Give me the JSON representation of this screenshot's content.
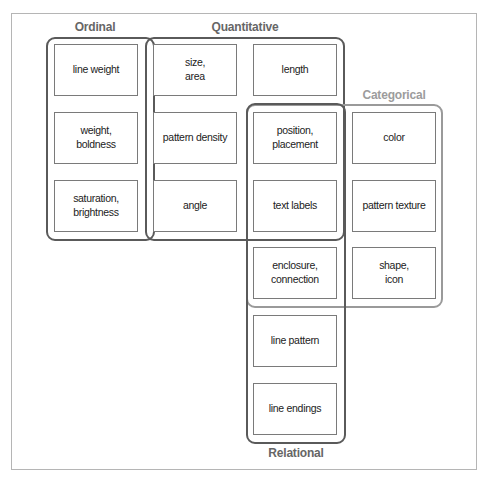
{
  "diagram": {
    "groups": [
      {
        "id": "ordinal",
        "label": "Ordinal"
      },
      {
        "id": "quantitative",
        "label": "Quantitative"
      },
      {
        "id": "categorical",
        "label": "Categorical"
      },
      {
        "id": "relational",
        "label": "Relational"
      }
    ],
    "cells": {
      "line_weight": "line weight",
      "weight_boldness": "weight,\nboldness",
      "saturation_brightness": "saturation,\nbrightness",
      "size_area": "size,\narea",
      "pattern_density": "pattern density",
      "angle": "angle",
      "length": "length",
      "position_placement": "position,\nplacement",
      "text_labels": "text labels",
      "enclosure_connection": "enclosure,\nconnection",
      "line_pattern": "line pattern",
      "line_endings": "line endings",
      "color": "color",
      "pattern_texture": "pattern texture",
      "shape_icon": "shape,\nicon"
    },
    "colors": {
      "group_stroke": "#5a5a5a",
      "categorical_stroke": "#9a9a9a",
      "cell_stroke": "#7a7a7a",
      "frame_stroke": "#b5b5b5"
    }
  }
}
